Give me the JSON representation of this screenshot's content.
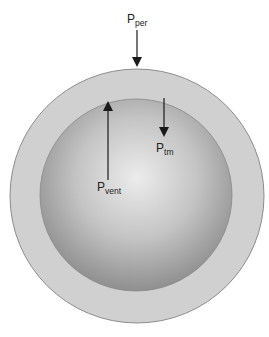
{
  "diagram": {
    "type": "pressure-sphere",
    "labels": {
      "per": {
        "main": "P",
        "sub": "per"
      },
      "tm": {
        "main": "P",
        "sub": "tm"
      },
      "vent": {
        "main": "P",
        "sub": "vent"
      }
    },
    "colors": {
      "outer_ring": "#cfcfcf",
      "outer_stroke": "#8a8a8a",
      "inner_center": "#ececec",
      "inner_edge": "#959595",
      "arrow": "#1a1a1a"
    }
  }
}
